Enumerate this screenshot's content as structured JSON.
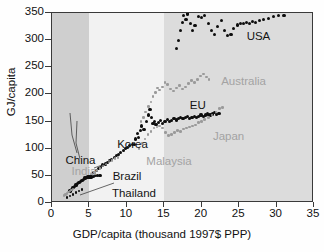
{
  "chart_data": {
    "type": "scatter",
    "title": "",
    "xlabel": "GDP/capita (thousand 1997$ PPP)",
    "ylabel": "GJ/capita",
    "xlim": [
      0,
      35
    ],
    "ylim": [
      0,
      350
    ],
    "xticks": [
      0,
      5,
      10,
      15,
      20,
      25,
      30,
      35
    ],
    "yticks": [
      0,
      50,
      100,
      150,
      200,
      250,
      300,
      350
    ],
    "grid": false,
    "legend": "inline-annotations",
    "background_bands": [
      {
        "name": "low-income-band",
        "x0": 0,
        "x1": 5,
        "color": "#cfcfcf"
      },
      {
        "name": "middle-income-band",
        "x0": 5,
        "x1": 15,
        "color": "#f2f2f2"
      },
      {
        "name": "high-income-band",
        "x0": 15,
        "x1": 35,
        "color": "#dcdcdc"
      }
    ],
    "annotations": [
      {
        "label": "USA",
        "color": "#141414",
        "x": 26.0,
        "y": 305
      },
      {
        "label": "Australia",
        "color": "#a3a3a3",
        "x": 22.6,
        "y": 222
      },
      {
        "label": "EU",
        "color": "#141414",
        "x": 18.4,
        "y": 178
      },
      {
        "label": "Japan",
        "color": "#a3a3a3",
        "x": 21.5,
        "y": 122
      },
      {
        "label": "Korea",
        "color": "#141414",
        "x": 8.7,
        "y": 106
      },
      {
        "label": "Malaysia",
        "color": "#a3a3a3",
        "x": 12.6,
        "y": 76
      },
      {
        "label": "China",
        "color": "#141414",
        "x": 1.8,
        "y": 77
      },
      {
        "label": "India",
        "color": "#a3a3a3",
        "x": 2.6,
        "y": 57
      },
      {
        "label": "Brazil",
        "color": "#141414",
        "x": 8.1,
        "y": 47
      },
      {
        "label": "Thailand",
        "color": "#141414",
        "x": 8.0,
        "y": 17
      }
    ],
    "series": [
      {
        "name": "USA",
        "color": "#0d0d0d",
        "marker": "filled-circle",
        "points": [
          [
            16.6,
            285
          ],
          [
            16.9,
            300
          ],
          [
            17.2,
            318
          ],
          [
            17.4,
            332
          ],
          [
            17.6,
            345
          ],
          [
            17.9,
            338
          ],
          [
            18.1,
            348
          ],
          [
            18.5,
            330
          ],
          [
            18.8,
            318
          ],
          [
            19.1,
            327
          ],
          [
            19.6,
            344
          ],
          [
            20.0,
            342
          ],
          [
            20.4,
            346
          ],
          [
            20.9,
            330
          ],
          [
            21.3,
            318
          ],
          [
            21.7,
            310
          ],
          [
            22.1,
            325
          ],
          [
            22.6,
            336
          ],
          [
            23.0,
            318
          ],
          [
            23.4,
            308
          ],
          [
            23.9,
            310
          ],
          [
            24.3,
            322
          ],
          [
            24.8,
            328
          ],
          [
            25.2,
            330
          ],
          [
            25.6,
            331
          ],
          [
            26.0,
            332
          ],
          [
            26.4,
            331
          ],
          [
            26.8,
            334
          ],
          [
            27.2,
            333
          ],
          [
            27.7,
            336
          ],
          [
            28.2,
            338
          ],
          [
            28.9,
            340
          ],
          [
            29.6,
            344
          ],
          [
            30.3,
            345
          ],
          [
            31.0,
            346
          ]
        ]
      },
      {
        "name": "Australia",
        "color": "#9a9a9a",
        "marker": "filled-circle",
        "points": [
          [
            11.9,
            150
          ],
          [
            12.2,
            158
          ],
          [
            12.5,
            168
          ],
          [
            12.9,
            178
          ],
          [
            13.2,
            186
          ],
          [
            13.5,
            196
          ],
          [
            13.8,
            204
          ],
          [
            14.1,
            212
          ],
          [
            14.4,
            208
          ],
          [
            14.8,
            214
          ],
          [
            15.1,
            222
          ],
          [
            15.4,
            218
          ],
          [
            15.8,
            210
          ],
          [
            16.2,
            206
          ],
          [
            16.6,
            212
          ],
          [
            17.0,
            216
          ],
          [
            17.4,
            210
          ],
          [
            17.8,
            214
          ],
          [
            18.2,
            220
          ],
          [
            18.6,
            226
          ],
          [
            19.0,
            222
          ],
          [
            19.4,
            228
          ],
          [
            19.8,
            234
          ],
          [
            20.2,
            238
          ],
          [
            20.6,
            232
          ],
          [
            21.0,
            228
          ]
        ]
      },
      {
        "name": "EU",
        "color": "#0d0d0d",
        "marker": "filled-circle",
        "points": [
          [
            11.0,
            108
          ],
          [
            11.2,
            118
          ],
          [
            11.4,
            128
          ],
          [
            11.6,
            120
          ],
          [
            11.8,
            134
          ],
          [
            12.0,
            142
          ],
          [
            12.3,
            136
          ],
          [
            12.6,
            150
          ],
          [
            12.9,
            162
          ],
          [
            13.1,
            172
          ],
          [
            13.3,
            158
          ],
          [
            13.5,
            146
          ],
          [
            13.7,
            150
          ],
          [
            13.9,
            144
          ],
          [
            14.2,
            148
          ],
          [
            14.5,
            152
          ],
          [
            14.8,
            146
          ],
          [
            15.1,
            150
          ],
          [
            15.4,
            154
          ],
          [
            15.7,
            150
          ],
          [
            16.0,
            152
          ],
          [
            16.3,
            156
          ],
          [
            16.6,
            153
          ],
          [
            16.9,
            156
          ],
          [
            17.2,
            158
          ],
          [
            17.5,
            155
          ],
          [
            17.8,
            157
          ],
          [
            18.1,
            159
          ],
          [
            18.4,
            156
          ],
          [
            18.7,
            158
          ],
          [
            19.0,
            160
          ],
          [
            19.3,
            158
          ],
          [
            19.6,
            160
          ],
          [
            19.9,
            162
          ],
          [
            20.2,
            160
          ],
          [
            20.5,
            162
          ],
          [
            20.8,
            164
          ],
          [
            21.1,
            162
          ],
          [
            21.4,
            164
          ],
          [
            21.7,
            166
          ],
          [
            22.0,
            163
          ],
          [
            22.3,
            165
          ]
        ]
      },
      {
        "name": "Japan",
        "color": "#9a9a9a",
        "marker": "filled-circle",
        "points": [
          [
            11.6,
            100
          ],
          [
            12.0,
            110
          ],
          [
            12.4,
            118
          ],
          [
            12.8,
            126
          ],
          [
            13.2,
            132
          ],
          [
            13.6,
            138
          ],
          [
            14.0,
            140
          ],
          [
            14.4,
            142
          ],
          [
            14.8,
            138
          ],
          [
            15.2,
            130
          ],
          [
            15.6,
            124
          ],
          [
            16.0,
            126
          ],
          [
            16.4,
            130
          ],
          [
            16.8,
            134
          ],
          [
            17.2,
            132
          ],
          [
            17.6,
            136
          ],
          [
            18.0,
            138
          ],
          [
            18.4,
            140
          ],
          [
            18.8,
            142
          ],
          [
            19.2,
            144
          ],
          [
            19.6,
            148
          ],
          [
            20.0,
            150
          ],
          [
            20.4,
            154
          ],
          [
            20.9,
            158
          ],
          [
            21.4,
            162
          ],
          [
            21.9,
            168
          ],
          [
            22.4,
            174
          ],
          [
            22.8,
            176
          ]
        ]
      },
      {
        "name": "Korea",
        "color": "#0d0d0d",
        "marker": "filled-circle",
        "points": [
          [
            5.6,
            56
          ],
          [
            5.9,
            60
          ],
          [
            6.2,
            63
          ],
          [
            6.5,
            66
          ],
          [
            6.8,
            70
          ],
          [
            7.1,
            72
          ],
          [
            7.4,
            74
          ],
          [
            7.7,
            78
          ],
          [
            8.0,
            80
          ],
          [
            8.3,
            84
          ],
          [
            8.6,
            87
          ],
          [
            8.9,
            90
          ],
          [
            9.2,
            93
          ],
          [
            9.5,
            96
          ],
          [
            9.8,
            100
          ],
          [
            10.1,
            102
          ],
          [
            10.4,
            106
          ],
          [
            10.7,
            108
          ]
        ]
      },
      {
        "name": "Malaysia",
        "color": "#9a9a9a",
        "marker": "filled-circle",
        "points": [
          [
            5.3,
            52
          ],
          [
            5.7,
            56
          ],
          [
            6.0,
            60
          ],
          [
            6.4,
            64
          ],
          [
            6.8,
            68
          ],
          [
            7.2,
            72
          ],
          [
            7.6,
            76
          ],
          [
            8.0,
            78
          ],
          [
            8.4,
            82
          ],
          [
            8.8,
            84
          ]
        ]
      },
      {
        "name": "China",
        "color": "#0d0d0d",
        "marker": "filled-circle",
        "points": [
          [
            2.4,
            22
          ],
          [
            2.6,
            25
          ],
          [
            2.8,
            28
          ],
          [
            3.0,
            30
          ],
          [
            3.2,
            33
          ],
          [
            3.4,
            36
          ],
          [
            3.6,
            38
          ],
          [
            3.8,
            40
          ],
          [
            4.0,
            42
          ],
          [
            4.2,
            44
          ],
          [
            4.4,
            46
          ],
          [
            4.6,
            47
          ],
          [
            4.8,
            48
          ],
          [
            5.0,
            48
          ]
        ]
      },
      {
        "name": "India",
        "color": "#9a9a9a",
        "marker": "filled-circle",
        "points": [
          [
            1.6,
            14
          ],
          [
            1.8,
            16
          ],
          [
            2.0,
            18
          ],
          [
            2.2,
            20
          ],
          [
            2.4,
            22
          ],
          [
            2.6,
            24
          ],
          [
            2.8,
            26
          ]
        ]
      },
      {
        "name": "Brazil",
        "color": "#0d0d0d",
        "marker": "filled-circle",
        "points": [
          [
            5.2,
            48
          ],
          [
            5.5,
            49
          ],
          [
            5.8,
            50
          ],
          [
            6.1,
            50
          ],
          [
            6.4,
            51
          ]
        ]
      },
      {
        "name": "Thailand",
        "color": "#0d0d0d",
        "marker": "filled-circle",
        "points": [
          [
            2.0,
            10
          ],
          [
            2.4,
            13
          ],
          [
            2.8,
            16
          ],
          [
            3.2,
            19
          ],
          [
            3.6,
            22
          ],
          [
            4.0,
            25
          ]
        ]
      }
    ]
  }
}
